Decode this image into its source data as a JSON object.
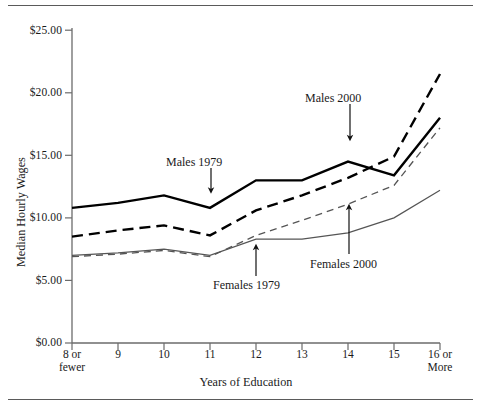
{
  "chart_data": {
    "type": "line",
    "title": "",
    "xlabel": "Years of Education",
    "ylabel": "Median Hourly Wages",
    "categories": [
      "8 or fewer",
      "9",
      "10",
      "11",
      "12",
      "13",
      "14",
      "15",
      "16 or More"
    ],
    "x_tick_lines": [
      [
        "8 or",
        "fewer"
      ],
      [
        "9"
      ],
      [
        "10"
      ],
      [
        "11"
      ],
      [
        "12"
      ],
      [
        "13"
      ],
      [
        "14"
      ],
      [
        "15"
      ],
      [
        "16 or",
        "More"
      ]
    ],
    "y_ticks": [
      "$0.00",
      "$5.00",
      "$10.00",
      "$15.00",
      "$20.00",
      "$25.00"
    ],
    "y_tick_values": [
      0,
      5,
      10,
      15,
      20,
      25
    ],
    "ylim": [
      0,
      25
    ],
    "grid": false,
    "legend": "inline-annotations",
    "series": [
      {
        "name": "Males 1979",
        "style": "solid-thick",
        "color": "#000000",
        "values": [
          10.8,
          11.2,
          11.8,
          10.8,
          13.0,
          13.0,
          14.5,
          13.4,
          18.0
        ]
      },
      {
        "name": "Males 2000",
        "style": "dashed-thick",
        "color": "#000000",
        "values": [
          8.5,
          9.0,
          9.4,
          8.6,
          10.6,
          11.8,
          13.2,
          14.9,
          21.5
        ]
      },
      {
        "name": "Females 1979",
        "style": "solid-thin",
        "color": "#555555",
        "values": [
          7.0,
          7.2,
          7.5,
          7.0,
          8.3,
          8.3,
          8.8,
          10.0,
          12.2
        ]
      },
      {
        "name": "Females 2000",
        "style": "dashed-thin",
        "color": "#555555",
        "values": [
          6.9,
          7.1,
          7.4,
          6.9,
          8.6,
          9.8,
          11.1,
          12.6,
          17.2
        ]
      }
    ],
    "annotations": [
      {
        "text": "Males 1979",
        "target_series": "Males 1979",
        "target_category": "11"
      },
      {
        "text": "Males 2000",
        "target_series": "Males 2000",
        "target_category": "13"
      },
      {
        "text": "Females 1979",
        "target_series": "Females 1979",
        "target_category": "12"
      },
      {
        "text": "Females 2000",
        "target_series": "Females 2000",
        "target_category": "14"
      }
    ]
  }
}
